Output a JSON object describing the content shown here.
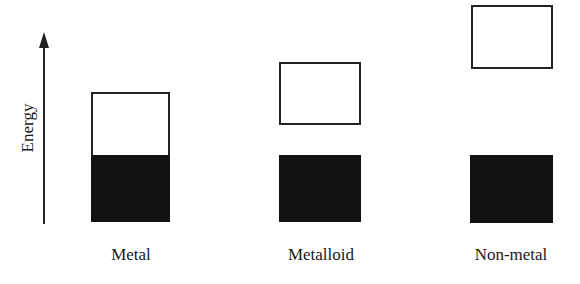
{
  "axis": {
    "label": "Energy",
    "direction": "up"
  },
  "materials": [
    {
      "name": "Metal",
      "bands": "overlapping conduction and valence bands"
    },
    {
      "name": "Metalloid",
      "bands": "small band gap"
    },
    {
      "name": "Non-metal",
      "bands": "large band gap"
    }
  ],
  "colors": {
    "filled_band": "#111111",
    "empty_band": "#ffffff",
    "outline": "#222222"
  }
}
